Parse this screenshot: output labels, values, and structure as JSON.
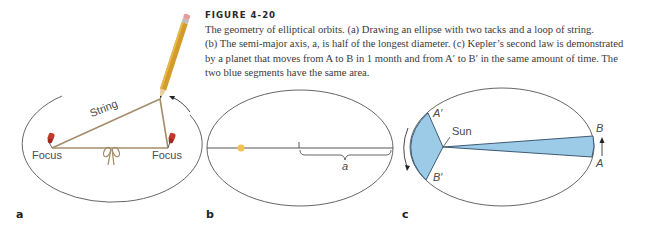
{
  "caption": {
    "figure_label": "FIGURE 4-20",
    "lines": [
      "The geometry of elliptical orbits. (a) Drawing an ellipse with two tacks and a loop of string.",
      "(b) The semi-major axis, a, is half of the longest diameter. (c) Kepler’s second law is demonstrated",
      "by a planet that moves from A to B in 1 month and from A′ to B′ in the same amount of time. The",
      "two blue segments have the same area."
    ]
  },
  "panels": {
    "a": {
      "label": "a",
      "string_label": "String",
      "focus_left_label": "Focus",
      "focus_right_label": "Focus"
    },
    "b": {
      "label": "b",
      "semi_major_label": "a"
    },
    "c": {
      "label": "c",
      "sun_label": "Sun",
      "point_a_prime": "A′",
      "point_b_prime": "B′",
      "point_a": "A",
      "point_b": "B"
    }
  },
  "colors": {
    "ellipse_stroke": "#555555",
    "string": "#a08a6a",
    "pin_red": "#c0392b",
    "sun_yellow": "#f2c14e",
    "area_blue": "#9ccbe8",
    "area_stroke": "#2f4a66"
  }
}
